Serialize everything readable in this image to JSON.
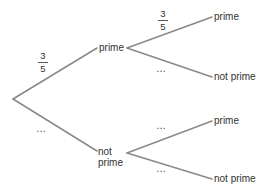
{
  "diagram": {
    "type": "probability-tree",
    "root": {
      "branches": [
        {
          "label": "prime",
          "probability": {
            "numerator": "3",
            "denominator": "5"
          },
          "children": [
            {
              "label": "prime",
              "probability": {
                "numerator": "3",
                "denominator": "5"
              }
            },
            {
              "label": "not prime",
              "probability": "…"
            }
          ]
        },
        {
          "label_line1": "not",
          "label_line2": "prime",
          "probability": "…",
          "children": [
            {
              "label": "prime",
              "probability": "…"
            },
            {
              "label": "not prime",
              "probability": "…"
            }
          ]
        }
      ]
    },
    "line_color": "#8a8a8a",
    "text_color": "#333333"
  }
}
